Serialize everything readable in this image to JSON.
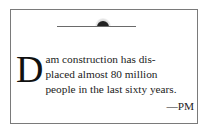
{
  "ornament": {
    "icon": "rising-sun-ornament"
  },
  "quote": {
    "drop_cap": "D",
    "line1": "am construction has dis-",
    "line2": "placed almost 80 million",
    "line3": "people in the last sixty years."
  },
  "attribution": "—PM"
}
